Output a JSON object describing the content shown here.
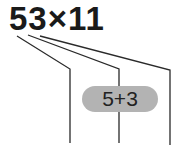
{
  "expression": "53×11",
  "pill": {
    "text": "5+3",
    "color": "#b3b3b3"
  },
  "line_color": "#2a2a2a"
}
